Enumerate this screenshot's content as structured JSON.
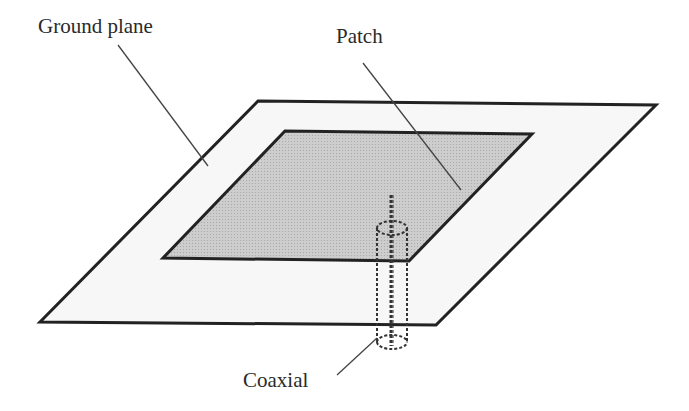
{
  "figure": {
    "labels": {
      "ground_plane": "Ground plane",
      "patch": "Patch",
      "coaxial": "Coaxial"
    },
    "colors": {
      "background": "#ffffff",
      "ground_plane_fill": "#f7f7f7",
      "patch_fill": "#c8c8c8",
      "outline": "#222222",
      "leader": "#444444"
    }
  }
}
